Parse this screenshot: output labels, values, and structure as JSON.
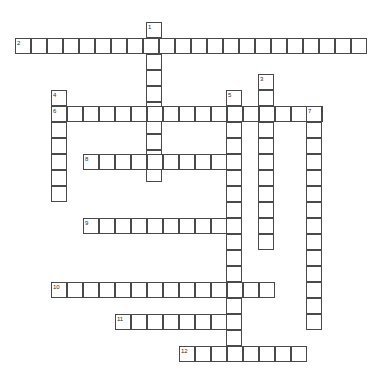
{
  "puzzle": {
    "type": "crossword-grid",
    "title": "",
    "canvas": {
      "width": 385,
      "height": 388
    },
    "cell_size": 16,
    "grid_origin": {
      "x": 15,
      "y": 22
    },
    "colors": {
      "cell_border": "#4a4a4a",
      "cell_fill": "#ffffff",
      "number_text": "#2b2b2b",
      "background": "#ffffff"
    },
    "entries": [
      {
        "number": "1",
        "direction": "down",
        "length": 10,
        "start": {
          "x": 146,
          "y": 22
        },
        "label_pos": {
          "x": 148,
          "y": 24
        }
      },
      {
        "number": "2",
        "direction": "across",
        "length": 22,
        "start": {
          "x": 15,
          "y": 38
        },
        "label_pos": {
          "x": 17,
          "y": 40
        }
      },
      {
        "number": "3",
        "direction": "down",
        "length": 11,
        "start": {
          "x": 258,
          "y": 74
        },
        "label_pos": {
          "x": 260,
          "y": 76
        }
      },
      {
        "number": "4",
        "direction": "down",
        "length": 7,
        "start": {
          "x": 51,
          "y": 90
        },
        "label_pos": {
          "x": 53,
          "y": 92
        }
      },
      {
        "number": "5",
        "direction": "down",
        "length": 17,
        "start": {
          "x": 226,
          "y": 90
        },
        "label_pos": {
          "x": 228,
          "y": 92
        }
      },
      {
        "number": "6",
        "direction": "across",
        "length": 17,
        "start": {
          "x": 51,
          "y": 106
        },
        "label_pos": {
          "x": 53,
          "y": 108
        }
      },
      {
        "number": "7",
        "direction": "down",
        "length": 14,
        "start": {
          "x": 306,
          "y": 106
        },
        "label_pos": {
          "x": 308,
          "y": 108
        }
      },
      {
        "number": "8",
        "direction": "across",
        "length": 9,
        "start": {
          "x": 83,
          "y": 154
        },
        "label_pos": {
          "x": 85,
          "y": 156
        }
      },
      {
        "number": "9",
        "direction": "across",
        "length": 9,
        "start": {
          "x": 83,
          "y": 218
        },
        "label_pos": {
          "x": 85,
          "y": 220
        }
      },
      {
        "number": "10",
        "direction": "across",
        "length": 14,
        "start": {
          "x": 51,
          "y": 282
        },
        "label_pos": {
          "x": 53,
          "y": 284
        }
      },
      {
        "number": "11",
        "direction": "across",
        "length": 7,
        "start": {
          "x": 115,
          "y": 314
        },
        "label_pos": {
          "x": 117,
          "y": 316
        }
      },
      {
        "number": "12",
        "direction": "across",
        "length": 8,
        "start": {
          "x": 179,
          "y": 346
        },
        "label_pos": {
          "x": 181,
          "y": 348
        }
      }
    ]
  }
}
